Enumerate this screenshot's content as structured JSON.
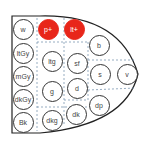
{
  "diagram": {
    "title": "",
    "highlight_color": "#e8261a",
    "tones": [
      {
        "id": "w",
        "label": "w",
        "x": 23,
        "y": 29,
        "highlight": false
      },
      {
        "id": "p+",
        "label": "p+",
        "x": 48,
        "y": 29,
        "highlight": true
      },
      {
        "id": "lt+",
        "label": "lt+",
        "x": 74,
        "y": 29,
        "highlight": true
      },
      {
        "id": "b",
        "label": "b",
        "x": 99,
        "y": 45,
        "highlight": false
      },
      {
        "id": "ltGy",
        "label": "ltGy",
        "x": 23,
        "y": 53,
        "highlight": false
      },
      {
        "id": "ltg",
        "label": "ltg",
        "x": 52,
        "y": 61,
        "highlight": false
      },
      {
        "id": "sf",
        "label": "sf",
        "x": 77,
        "y": 63,
        "highlight": false
      },
      {
        "id": "mGy",
        "label": "mGy",
        "x": 23,
        "y": 76,
        "highlight": false
      },
      {
        "id": "s",
        "label": "s",
        "x": 100,
        "y": 74,
        "highlight": false
      },
      {
        "id": "v",
        "label": "v",
        "x": 127,
        "y": 74,
        "highlight": false
      },
      {
        "id": "g",
        "label": "g",
        "x": 52,
        "y": 91,
        "highlight": false
      },
      {
        "id": "d",
        "label": "d",
        "x": 77,
        "y": 88,
        "highlight": false
      },
      {
        "id": "dkGy",
        "label": "dkGy",
        "x": 23,
        "y": 99,
        "highlight": false
      },
      {
        "id": "dp",
        "label": "dp",
        "x": 99,
        "y": 105,
        "highlight": false
      },
      {
        "id": "Bk",
        "label": "Bk",
        "x": 23,
        "y": 122,
        "highlight": false
      },
      {
        "id": "dkg",
        "label": "dkg",
        "x": 52,
        "y": 120,
        "highlight": false
      },
      {
        "id": "dk",
        "label": "dk",
        "x": 76,
        "y": 114,
        "highlight": false
      }
    ]
  }
}
